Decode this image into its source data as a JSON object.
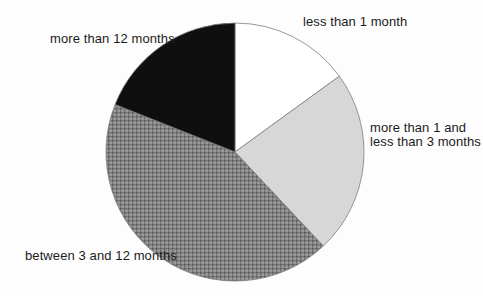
{
  "chart_data": {
    "type": "pie",
    "title": "",
    "categories": [
      "less than 1 month",
      "more than 1 and less than 3 months",
      "between 3 and 12 months",
      "more than 12 months"
    ],
    "values": [
      15,
      23,
      43,
      19
    ],
    "start_angle_deg": 0,
    "direction": "clockwise",
    "legend_position": "labels-around-pie",
    "outline_color": "#7d7d7d",
    "slices": [
      {
        "label": "less than 1 month",
        "value_pct": 15,
        "fill": "#ffffff",
        "pattern": "none"
      },
      {
        "label": "more than 1 and less than 3 months",
        "value_pct": 23,
        "fill": "#d7d7d7",
        "pattern": "none"
      },
      {
        "label": "between 3 and 12 months",
        "value_pct": 43,
        "fill": "#9a9a9a",
        "pattern": "crosshatch-grid"
      },
      {
        "label": "more than 12 months",
        "value_pct": 19,
        "fill": "#0f0f0f",
        "pattern": "none"
      }
    ]
  },
  "labels": {
    "less_than_1_month": "less than 1 month",
    "one_to_three_months": "more than 1 and\nless than 3 months",
    "three_to_twelve_months": "between 3 and 12 months",
    "more_than_12_months": "more than 12 months"
  }
}
